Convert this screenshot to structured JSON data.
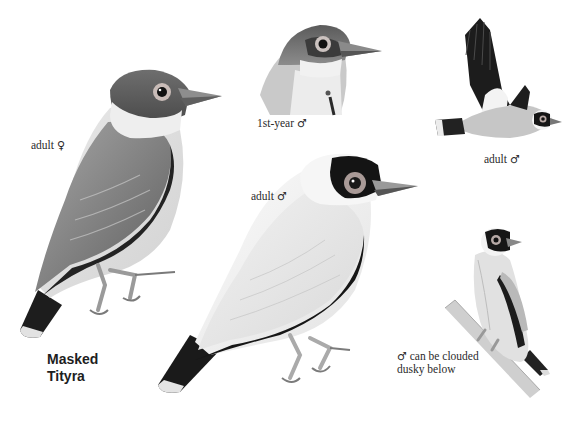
{
  "plate": {
    "species_title_line1": "Masked",
    "species_title_line2": "Tityra",
    "background_color": "#ffffff"
  },
  "figures": [
    {
      "id": "adult-female",
      "label_text": "adult",
      "label_symbol": "♀",
      "pose": "perched, three-quarter view"
    },
    {
      "id": "first-year-male",
      "label_text": "1st-year",
      "label_symbol": "♂",
      "pose": "head and neck only"
    },
    {
      "id": "adult-male-flight",
      "label_text": "adult",
      "label_symbol": "♂",
      "pose": "in flight"
    },
    {
      "id": "adult-male",
      "label_text": "adult",
      "label_symbol": "♂",
      "pose": "perched, large"
    },
    {
      "id": "male-clouded",
      "label_symbol": "♂",
      "label_line1": "can be clouded",
      "label_line2": "dusky below",
      "pose": "perched on branch, front view"
    }
  ],
  "colors": {
    "ink_dark": "#1b1b1b",
    "mask_black": "#151515",
    "gray_mid": "#8a8a8a",
    "gray_light": "#cfcfcf",
    "white_plumage": "#f4f4f4",
    "eye_ring": "#b9a9a5",
    "bill": "#9a9a9a"
  }
}
